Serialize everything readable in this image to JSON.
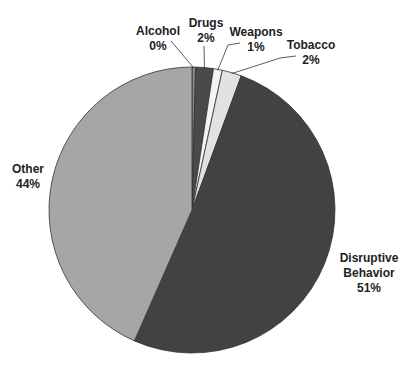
{
  "chart_data": {
    "type": "pie",
    "title": "",
    "start_angle_deg": 0,
    "direction": "clockwise",
    "slices": [
      {
        "label": "Alcohol",
        "pct_label": "0%",
        "value": 0.4,
        "color": "#8a8a8a"
      },
      {
        "label": "Drugs",
        "pct_label": "2%",
        "value": 2,
        "color": "#4a4a4a"
      },
      {
        "label": "Weapons",
        "pct_label": "1%",
        "value": 1,
        "color": "#f4f4f4"
      },
      {
        "label": "Tobacco",
        "pct_label": "2%",
        "value": 2.2,
        "color": "#e2e2e2"
      },
      {
        "label": "Disruptive Behavior",
        "pct_label": "51%",
        "value": 51,
        "color": "#424242"
      },
      {
        "label": "Other",
        "pct_label": "44%",
        "value": 43.4,
        "color": "#a6a6a6"
      }
    ],
    "legend": "none (direct labels)"
  },
  "labels": {
    "alcohol": {
      "name": "Alcohol",
      "pct": "0%"
    },
    "drugs": {
      "name": "Drugs",
      "pct": "2%"
    },
    "weapons": {
      "name": "Weapons",
      "pct": "1%"
    },
    "tobacco": {
      "name": "Tobacco",
      "pct": "2%"
    },
    "disruptive": {
      "name1": "Disruptive",
      "name2": "Behavior",
      "pct": "51%"
    },
    "other": {
      "name": "Other",
      "pct": "44%"
    }
  }
}
